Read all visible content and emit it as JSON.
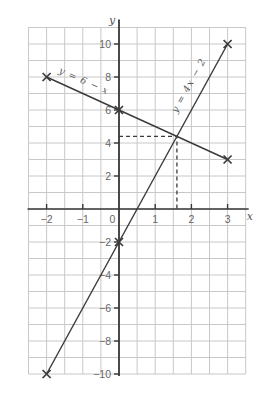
{
  "chart_data": {
    "type": "line",
    "title": "",
    "axes": {
      "xlabel": "x",
      "ylabel": "y",
      "xlim": [
        -2.5,
        3.5
      ],
      "ylim": [
        -10,
        11
      ],
      "x_grid_step": 0.5,
      "y_grid_step": 1,
      "x_ticks": [
        -2,
        -1,
        0,
        1,
        2,
        3
      ],
      "x_tick_labels": [
        "−2",
        "−1",
        "0",
        "1",
        "2",
        "3"
      ],
      "y_ticks": [
        10,
        8,
        6,
        4,
        2,
        -2,
        -4,
        -6,
        -8,
        -10
      ],
      "y_tick_labels": [
        "10",
        "8",
        "6",
        "4",
        "2",
        "−2",
        "−4",
        "−6",
        "−8",
        "−10"
      ],
      "grid": true
    },
    "series": [
      {
        "name": "y = 6 − x",
        "equation": "y = 6 − x",
        "points": [
          [
            -2,
            8
          ],
          [
            0,
            6
          ],
          [
            3,
            3
          ]
        ],
        "marker": "x",
        "label": {
          "text": "y = 6 − x",
          "x": -1.0,
          "y": 7.6,
          "angle": 24
        }
      },
      {
        "name": "y = 4x − 2",
        "equation": "y = 4x − 2",
        "points": [
          [
            -2,
            -10
          ],
          [
            0,
            -2
          ],
          [
            3,
            10
          ]
        ],
        "marker": "x",
        "label": {
          "text": "y = 4x − 2",
          "x": 2.0,
          "y": 7.4,
          "angle": -61
        }
      }
    ],
    "intersection": {
      "x": 1.6,
      "y": 4.4,
      "dashed_guides_to_axes": true
    },
    "colors": {
      "line": "#3a3a3a",
      "axis": "#383838",
      "grid": "#c8c8c8",
      "tick_text": "#676767",
      "equation_text": "#5a5a5a",
      "background": "#ffffff"
    }
  }
}
